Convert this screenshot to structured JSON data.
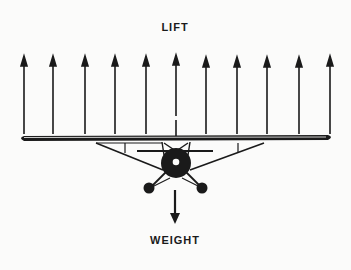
{
  "diagram": {
    "top_label": "LIFT",
    "bottom_label": "WEIGHT",
    "lift_arrow_count": 11,
    "ink_color": "#1a1a1a",
    "background_color": "#fbfbfa"
  }
}
